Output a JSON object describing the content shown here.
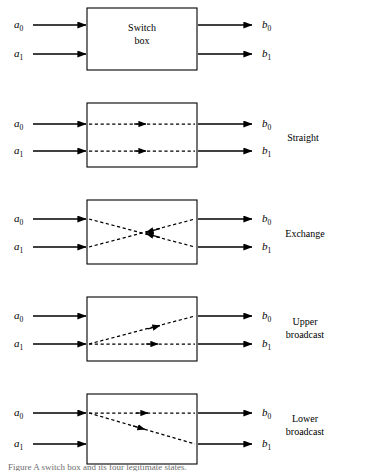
{
  "figure": {
    "caption": "Figure  A switch box and its four legitimate states.",
    "box_label_line1": "Switch",
    "box_label_line2": "box",
    "input_labels": {
      "a0_base": "a",
      "a0_sub": "0",
      "a1_base": "a",
      "a1_sub": "1"
    },
    "output_labels": {
      "b0_base": "b",
      "b0_sub": "0",
      "b1_base": "b",
      "b1_sub": "1"
    },
    "colors": {
      "stroke": "#000000",
      "background": "#ffffff",
      "caption": "#6e6e6e"
    }
  },
  "panels": [
    {
      "id": "switch-box",
      "mode_line1": "",
      "mode_line2": "",
      "in0": "a0",
      "in1": "a1",
      "out0": "b0",
      "out1": "b1",
      "internal": "none"
    },
    {
      "id": "straight",
      "mode_line1": "Straight",
      "mode_line2": "",
      "in0": "a0",
      "in1": "a1",
      "out0": "b0",
      "out1": "b1",
      "internal": "a0->b0, a1->b1"
    },
    {
      "id": "exchange",
      "mode_line1": "Exchange",
      "mode_line2": "",
      "in0": "a0",
      "in1": "a1",
      "out0": "b0",
      "out1": "b1",
      "internal": "a0->b1, a1->b0"
    },
    {
      "id": "upper-broadcast",
      "mode_line1": "Upper",
      "mode_line2": "broadcast",
      "in0": "a0",
      "in1": "a1",
      "out0": "b0",
      "out1": "b1",
      "internal": "a1->b0, a1->b1"
    },
    {
      "id": "lower-broadcast",
      "mode_line1": "Lower",
      "mode_line2": "broadcast",
      "in0": "a0",
      "in1": "a1",
      "out0": "b0",
      "out1": "b1",
      "internal": "a0->b0, a0->b1"
    }
  ]
}
